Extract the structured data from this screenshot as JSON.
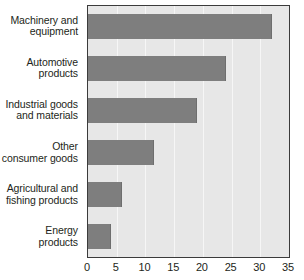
{
  "chart_data": {
    "type": "bar",
    "orientation": "horizontal",
    "title": "",
    "subtitle": "",
    "xlabel": "",
    "ylabel": "",
    "categories": [
      "Machinery and\nequipment",
      "Automotive\nproducts",
      "Industrial goods\nand materials",
      "Other\nconsumer goods",
      "Agricultural and\nfishing products",
      "Energy\nproducts"
    ],
    "values": [
      32,
      24,
      19,
      11.5,
      6,
      4
    ],
    "series": [
      {
        "name": "",
        "values": [
          32,
          24,
          19,
          11.5,
          6,
          4
        ]
      }
    ],
    "xlim": [
      0,
      35
    ],
    "xticks": [
      0,
      5,
      10,
      15,
      20,
      25,
      30,
      35
    ],
    "xtick_labels": [
      "0",
      "5",
      "10",
      "15",
      "20",
      "25",
      "30",
      "35"
    ],
    "grid": true,
    "grid_axis": "x",
    "legend": false,
    "legend_position": "none",
    "annotations": []
  },
  "style": {
    "bar_color": "#7e7e7e",
    "plot_background": "#e7e7e7",
    "page_background": "#ffffff",
    "gridline_color": "#f6f6f6",
    "axis_border_color": "#3b3b3b",
    "text_color": "#231f20"
  }
}
